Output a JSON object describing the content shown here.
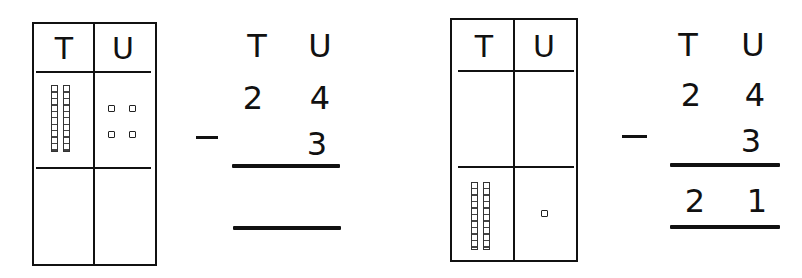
{
  "left_panel": {
    "place_value_chart": {
      "headers": [
        "T",
        "U"
      ],
      "top_row": {
        "tens_rods": 2,
        "unit_cubes": 4
      },
      "bottom_row": {
        "tens_rods": 0,
        "unit_cubes": 0
      }
    },
    "column_sum": {
      "headers": [
        "T",
        "U"
      ],
      "minuend": [
        "2",
        "4"
      ],
      "operator": "-",
      "subtrahend": [
        "",
        "3"
      ],
      "answer": [
        "",
        ""
      ]
    }
  },
  "right_panel": {
    "place_value_chart": {
      "headers": [
        "T",
        "U"
      ],
      "top_row": {
        "tens_rods": 0,
        "unit_cubes": 0
      },
      "bottom_row": {
        "tens_rods": 2,
        "unit_cubes": 1
      }
    },
    "column_sum": {
      "headers": [
        "T",
        "U"
      ],
      "minuend": [
        "2",
        "4"
      ],
      "operator": "-",
      "subtrahend": [
        "",
        "3"
      ],
      "answer": [
        "2",
        "1"
      ]
    }
  },
  "colors": {
    "ink": "#111111",
    "background": "#ffffff"
  }
}
